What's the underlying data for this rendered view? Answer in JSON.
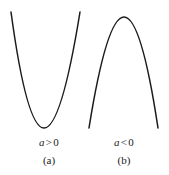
{
  "figure": {
    "background_color": "#ffffff",
    "stroke_color": "#1a1a1a",
    "stroke_width": 1.5,
    "width": 169,
    "height": 175
  },
  "panels": [
    {
      "id": "a",
      "tag": "(a)",
      "condition": {
        "variable": "a",
        "operator": ">",
        "value": "0"
      },
      "curve_name": "parabola-opening-upward"
    },
    {
      "id": "b",
      "tag": "(b)",
      "condition": {
        "variable": "a",
        "operator": "<",
        "value": "0"
      },
      "curve_name": "parabola-opening-downward"
    }
  ],
  "chart_data": {
    "type": "line",
    "title": "",
    "xlabel": "",
    "ylabel": "",
    "grid": false,
    "legend": null,
    "series": [
      {
        "name": "a > 0",
        "description": "Upward-opening parabola, vertex at bottom center of panel (a)",
        "vertex": [
          44,
          128
        ],
        "endpoints": [
          [
            11,
            12
          ],
          [
            80,
            12
          ]
        ],
        "x": [
          11,
          16,
          21,
          26,
          31,
          36,
          41,
          44,
          47,
          52,
          57,
          62,
          67,
          72,
          77,
          80
        ],
        "y": [
          12,
          30,
          52,
          72,
          93,
          111,
          124,
          128,
          127,
          120,
          107,
          90,
          70,
          48,
          22,
          12
        ]
      },
      {
        "name": "a < 0",
        "description": "Downward-opening parabola, apex at top center of panel (b)",
        "vertex": [
          124,
          17
        ],
        "endpoints": [
          [
            89,
            128
          ],
          [
            158,
            128
          ]
        ],
        "x": [
          89,
          94,
          99,
          104,
          109,
          114,
          119,
          124,
          129,
          134,
          139,
          144,
          149,
          154,
          158
        ],
        "y": [
          128,
          108,
          89,
          71,
          54,
          39,
          26,
          17,
          19,
          31,
          50,
          72,
          93,
          116,
          128
        ]
      }
    ]
  }
}
